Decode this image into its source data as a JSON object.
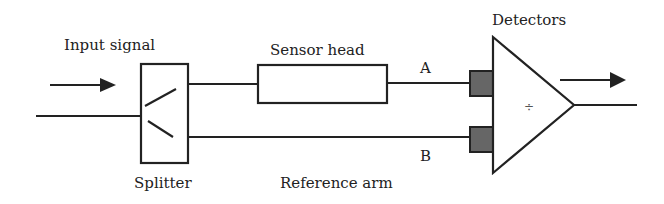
{
  "diagram": {
    "labels": {
      "input_signal": "Input signal",
      "splitter": "Splitter",
      "sensor_head": "Sensor head",
      "reference_arm": "Reference arm",
      "detectors": "Detectors",
      "path_a": "A",
      "path_b": "B",
      "divide_symbol": "÷"
    },
    "colors": {
      "line": "#222222",
      "detector_fill": "#666666",
      "background": "#ffffff"
    },
    "nodes": [
      {
        "id": "input",
        "label": "Input signal"
      },
      {
        "id": "splitter",
        "label": "Splitter"
      },
      {
        "id": "sensor-head",
        "label": "Sensor head"
      },
      {
        "id": "detector-a",
        "label": "A"
      },
      {
        "id": "detector-b",
        "label": "B"
      },
      {
        "id": "divider",
        "label": "÷"
      }
    ],
    "edges": [
      {
        "from": "input",
        "to": "splitter"
      },
      {
        "from": "splitter",
        "to": "sensor-head"
      },
      {
        "from": "sensor-head",
        "to": "detector-a",
        "label": "A"
      },
      {
        "from": "splitter",
        "to": "detector-b",
        "label": "B (Reference arm)"
      },
      {
        "from": "detector-a",
        "to": "divider"
      },
      {
        "from": "detector-b",
        "to": "divider"
      },
      {
        "from": "divider",
        "to": "output"
      }
    ]
  }
}
